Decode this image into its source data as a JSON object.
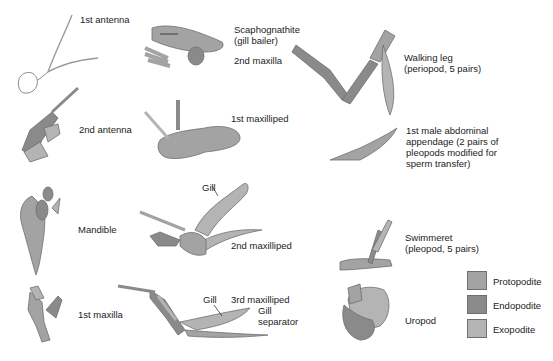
{
  "diagram": {
    "colors": {
      "protopodite": "#a3a3a3",
      "endopodite": "#8a8a8a",
      "exopodite": "#b4b4b4",
      "outline": "#6f6f6f"
    },
    "appendages": [
      {
        "id": "first-antenna",
        "label": "1st antenna"
      },
      {
        "id": "second-maxilla",
        "label": "2nd maxilla",
        "callout": "Scaphognathite\n(gill bailer)"
      },
      {
        "id": "walking-leg",
        "label": "Walking leg\n(periopod, 5 pairs)"
      },
      {
        "id": "second-antenna",
        "label": "2nd antenna"
      },
      {
        "id": "first-maxilliped",
        "label": "1st maxilliped"
      },
      {
        "id": "first-male-abdominal-appendage",
        "label": "1st male abdominal\nappendage (2 pairs of\npleopods modified for\nsperm transfer)"
      },
      {
        "id": "mandible",
        "label": "Mandible"
      },
      {
        "id": "second-maxilliped",
        "label": "2nd maxilliped",
        "callout": "Gill"
      },
      {
        "id": "swimmeret",
        "label": "Swimmeret\n(pleopod, 5 pairs)"
      },
      {
        "id": "first-maxilla",
        "label": "1st maxilla"
      },
      {
        "id": "third-maxilliped",
        "label": "3rd maxilliped",
        "callouts": [
          "Gill",
          "Gill\nseparator"
        ]
      },
      {
        "id": "uropod",
        "label": "Uropod"
      }
    ],
    "legend": [
      {
        "label": "Protopodite",
        "color": "#a3a3a3"
      },
      {
        "label": "Endopodite",
        "color": "#8a8a8a"
      },
      {
        "label": "Exopodite",
        "color": "#b4b4b4"
      }
    ]
  }
}
